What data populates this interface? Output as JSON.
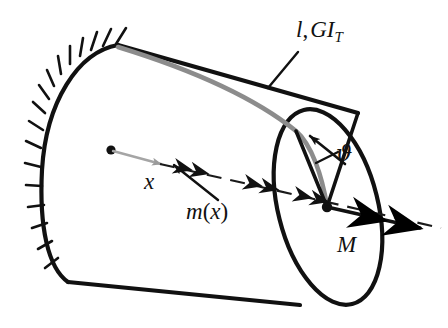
{
  "figure": {
    "background_color": "#ffffff",
    "stroke_color": "#111111",
    "generator_color": "#808080",
    "axis_color": "#1a1a1a"
  },
  "labels": {
    "length_stiffness": {
      "text": "l, GI_T",
      "parts": {
        "length": "l",
        "comma": ",",
        "modulus": "GI",
        "subscript": "T"
      },
      "x": 296,
      "y": 18
    },
    "twist_angle": {
      "text": "ϑ",
      "x": 336,
      "y": 142
    },
    "axial_coordinate": {
      "text": "x",
      "x": 144,
      "y": 170
    },
    "distributed_torque": {
      "text": "m(x)",
      "parts": {
        "symbol": "m",
        "open": "(",
        "argument": "x",
        "close": ")"
      },
      "x": 186,
      "y": 200
    },
    "end_torque": {
      "text": "M",
      "x": 337,
      "y": 233
    }
  },
  "geometry": {
    "left_face": {
      "cx": 92,
      "cy": 163,
      "rx": 52,
      "ry": 103,
      "rotation": -14
    },
    "right_face": {
      "cx": 328,
      "cy": 207,
      "rx": 50,
      "ry": 100,
      "rotation": -14
    },
    "hatch_marks": 13,
    "moment_arrow_groups": 3,
    "double_arrowhead": true
  },
  "icons": {
    "fixed_support": "hatch-icon",
    "torque_vector": "double-arrowhead-icon",
    "axis_arrow": "single-arrowhead-icon",
    "leader_line": "leader-line-icon"
  }
}
